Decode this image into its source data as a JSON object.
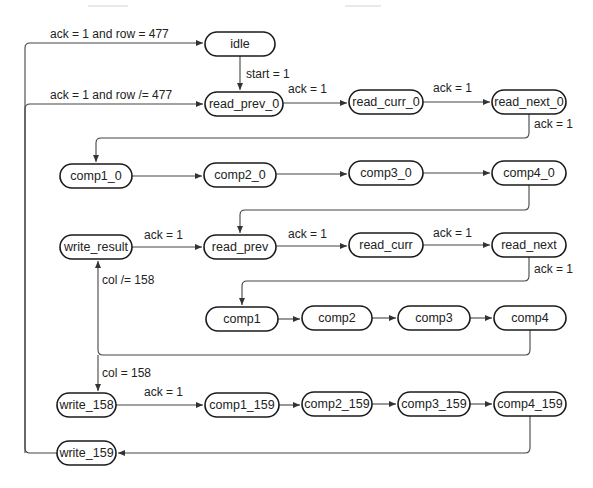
{
  "diagram": {
    "type": "state-machine",
    "nodes": [
      {
        "id": "idle",
        "label": "idle",
        "x": 205,
        "y": 32,
        "w": 70,
        "h": 24
      },
      {
        "id": "read_prev_0",
        "label": "read_prev_0",
        "x": 205,
        "y": 92,
        "w": 78,
        "h": 24
      },
      {
        "id": "read_curr_0",
        "label": "read_curr_0",
        "x": 349,
        "y": 90,
        "w": 74,
        "h": 24
      },
      {
        "id": "read_next_0",
        "label": "read_next_0",
        "x": 492,
        "y": 90,
        "w": 74,
        "h": 24
      },
      {
        "id": "comp1_0",
        "label": "comp1_0",
        "x": 60,
        "y": 164,
        "w": 72,
        "h": 24
      },
      {
        "id": "comp2_0",
        "label": "comp2_0",
        "x": 204,
        "y": 164,
        "w": 72,
        "h": 24
      },
      {
        "id": "comp3_0",
        "label": "comp3_0",
        "x": 349,
        "y": 161,
        "w": 74,
        "h": 24
      },
      {
        "id": "comp4_0",
        "label": "comp4_0",
        "x": 492,
        "y": 161,
        "w": 74,
        "h": 24
      },
      {
        "id": "write_result",
        "label": "write_result",
        "x": 60,
        "y": 235,
        "w": 72,
        "h": 24
      },
      {
        "id": "read_prev",
        "label": "read_prev",
        "x": 204,
        "y": 235,
        "w": 72,
        "h": 24
      },
      {
        "id": "read_curr",
        "label": "read_curr",
        "x": 349,
        "y": 233,
        "w": 74,
        "h": 24
      },
      {
        "id": "read_next",
        "label": "read_next",
        "x": 492,
        "y": 233,
        "w": 74,
        "h": 24
      },
      {
        "id": "comp1",
        "label": "comp1",
        "x": 206,
        "y": 307,
        "w": 72,
        "h": 24
      },
      {
        "id": "comp2",
        "label": "comp2",
        "x": 302,
        "y": 306,
        "w": 70,
        "h": 24
      },
      {
        "id": "comp3",
        "label": "comp3",
        "x": 398,
        "y": 306,
        "w": 72,
        "h": 24
      },
      {
        "id": "comp4",
        "label": "comp4",
        "x": 494,
        "y": 306,
        "w": 72,
        "h": 24
      },
      {
        "id": "write_158",
        "label": "write_158",
        "x": 60,
        "y": 393,
        "w": 56,
        "h": 24
      },
      {
        "id": "comp1_159",
        "label": "comp1_159",
        "x": 205,
        "y": 393,
        "w": 74,
        "h": 24
      },
      {
        "id": "comp2_159",
        "label": "comp2_159",
        "x": 302,
        "y": 392,
        "w": 70,
        "h": 24
      },
      {
        "id": "comp3_159",
        "label": "comp3_159",
        "x": 398,
        "y": 392,
        "w": 72,
        "h": 24
      },
      {
        "id": "comp4_159",
        "label": "comp4_159",
        "x": 494,
        "y": 392,
        "w": 72,
        "h": 24
      },
      {
        "id": "write_159",
        "label": "write_159",
        "x": 60,
        "y": 441,
        "w": 56,
        "h": 24
      }
    ],
    "edges": [
      {
        "from": "write_159",
        "to": "idle",
        "label": "ack = 1 and row = 477"
      },
      {
        "from": "write_159",
        "to": "read_prev_0",
        "label": "ack = 1 and row /= 477"
      },
      {
        "from": "idle",
        "to": "read_prev_0",
        "label": "start = 1"
      },
      {
        "from": "read_prev_0",
        "to": "read_curr_0",
        "label": "ack = 1"
      },
      {
        "from": "read_curr_0",
        "to": "read_next_0",
        "label": "ack = 1"
      },
      {
        "from": "read_next_0",
        "to": "comp1_0",
        "label": "ack = 1"
      },
      {
        "from": "comp1_0",
        "to": "comp2_0",
        "label": ""
      },
      {
        "from": "comp2_0",
        "to": "comp3_0",
        "label": ""
      },
      {
        "from": "comp3_0",
        "to": "comp4_0",
        "label": ""
      },
      {
        "from": "comp4_0",
        "to": "read_prev",
        "label": ""
      },
      {
        "from": "write_result",
        "to": "read_prev",
        "label": "ack = 1"
      },
      {
        "from": "read_prev",
        "to": "read_curr",
        "label": "ack = 1"
      },
      {
        "from": "read_curr",
        "to": "read_next",
        "label": "ack = 1"
      },
      {
        "from": "read_next",
        "to": "comp1",
        "label": "ack = 1"
      },
      {
        "from": "comp1",
        "to": "comp2",
        "label": ""
      },
      {
        "from": "comp2",
        "to": "comp3",
        "label": ""
      },
      {
        "from": "comp3",
        "to": "comp4",
        "label": ""
      },
      {
        "from": "comp4",
        "to": "write_result",
        "label": "col /= 158"
      },
      {
        "from": "comp4",
        "to": "write_158",
        "label": "col = 158"
      },
      {
        "from": "write_158",
        "to": "comp1_159",
        "label": "ack = 1"
      },
      {
        "from": "comp1_159",
        "to": "comp2_159",
        "label": ""
      },
      {
        "from": "comp2_159",
        "to": "comp3_159",
        "label": ""
      },
      {
        "from": "comp3_159",
        "to": "comp4_159",
        "label": ""
      },
      {
        "from": "comp4_159",
        "to": "write_159",
        "label": ""
      }
    ],
    "colors": {
      "node_stroke": "#1a1a1a",
      "edge_stroke": "#444444",
      "background": "#ffffff"
    }
  }
}
